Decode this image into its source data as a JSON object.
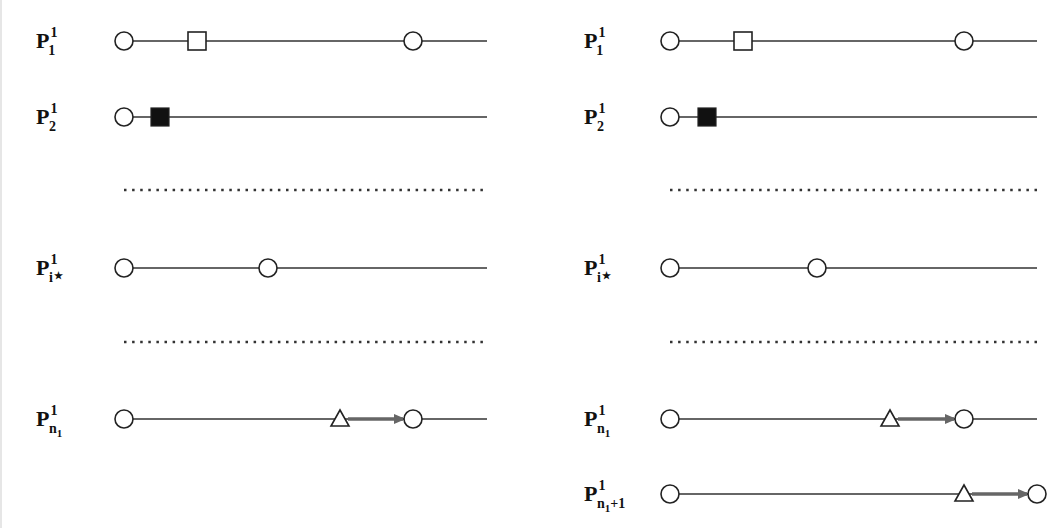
{
  "figure": {
    "width": 1062,
    "height": 528,
    "colors": {
      "line": "#333333",
      "arrow": "#666666",
      "shape_stroke": "#222222",
      "filled_square": "#111111",
      "dots": "#333333"
    }
  },
  "legend_shapes": [
    "circle",
    "open-square",
    "filled-square",
    "triangle",
    "arrow"
  ],
  "panels": [
    {
      "name": "left",
      "label_x": 36,
      "rows": [
        {
          "kind": "line",
          "label": {
            "base": "P",
            "sup": "1",
            "sub": "1"
          },
          "y": 41,
          "x1": 124,
          "x2": 487,
          "shapes": [
            {
              "type": "circle",
              "x": 124
            },
            {
              "type": "square",
              "x": 197
            },
            {
              "type": "circle",
              "x": 413
            }
          ]
        },
        {
          "kind": "line",
          "label": {
            "base": "P",
            "sup": "1",
            "sub": "2"
          },
          "y": 117,
          "x1": 124,
          "x2": 487,
          "shapes": [
            {
              "type": "circle",
              "x": 124
            },
            {
              "type": "filled-square",
              "x": 160
            }
          ]
        },
        {
          "kind": "dots",
          "y": 190,
          "x1": 124,
          "x2": 487
        },
        {
          "kind": "line",
          "label": {
            "base": "P",
            "sup": "1",
            "sub": "i*"
          },
          "y": 268,
          "x1": 124,
          "x2": 487,
          "shapes": [
            {
              "type": "circle",
              "x": 124
            },
            {
              "type": "circle",
              "x": 268
            }
          ]
        },
        {
          "kind": "dots",
          "y": 342,
          "x1": 124,
          "x2": 487
        },
        {
          "kind": "line",
          "label": {
            "base": "P",
            "sup": "1",
            "sub": "n1"
          },
          "y": 419,
          "x1": 124,
          "x2": 487,
          "shapes": [
            {
              "type": "circle",
              "x": 124
            },
            {
              "type": "triangle",
              "x": 340
            },
            {
              "type": "arrow",
              "x1": 348,
              "x2": 403
            },
            {
              "type": "circle",
              "x": 413
            }
          ]
        }
      ]
    },
    {
      "name": "right",
      "label_x": 584,
      "rows": [
        {
          "kind": "line",
          "label": {
            "base": "P",
            "sup": "1",
            "sub": "1"
          },
          "y": 41,
          "x1": 670,
          "x2": 1037,
          "shapes": [
            {
              "type": "circle",
              "x": 670
            },
            {
              "type": "square",
              "x": 743
            },
            {
              "type": "circle",
              "x": 964
            }
          ]
        },
        {
          "kind": "line",
          "label": {
            "base": "P",
            "sup": "1",
            "sub": "2"
          },
          "y": 117,
          "x1": 670,
          "x2": 1037,
          "shapes": [
            {
              "type": "circle",
              "x": 670
            },
            {
              "type": "filled-square",
              "x": 707
            }
          ]
        },
        {
          "kind": "dots",
          "y": 190,
          "x1": 670,
          "x2": 1037
        },
        {
          "kind": "line",
          "label": {
            "base": "P",
            "sup": "1",
            "sub": "i*"
          },
          "y": 268,
          "x1": 670,
          "x2": 1037,
          "shapes": [
            {
              "type": "circle",
              "x": 670
            },
            {
              "type": "circle",
              "x": 817
            }
          ]
        },
        {
          "kind": "dots",
          "y": 342,
          "x1": 670,
          "x2": 1037
        },
        {
          "kind": "line",
          "label": {
            "base": "P",
            "sup": "1",
            "sub": "n1"
          },
          "y": 419,
          "x1": 670,
          "x2": 1037,
          "shapes": [
            {
              "type": "circle",
              "x": 670
            },
            {
              "type": "triangle",
              "x": 890
            },
            {
              "type": "arrow",
              "x1": 898,
              "x2": 954
            },
            {
              "type": "circle",
              "x": 964
            }
          ]
        },
        {
          "kind": "line",
          "label": {
            "base": "P",
            "sup": "1",
            "sub": "n1+1"
          },
          "y": 494,
          "x1": 670,
          "x2": 1037,
          "shapes": [
            {
              "type": "circle",
              "x": 670
            },
            {
              "type": "triangle",
              "x": 964
            },
            {
              "type": "arrow",
              "x1": 972,
              "x2": 1027
            },
            {
              "type": "circle",
              "x": 1037
            }
          ]
        }
      ]
    }
  ]
}
